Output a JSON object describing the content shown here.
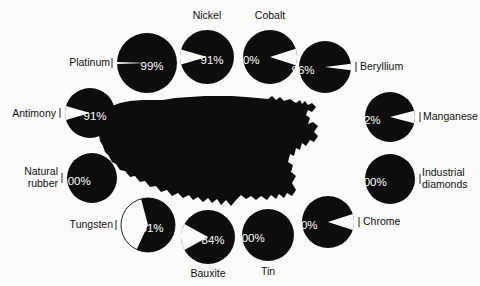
{
  "figure": {
    "background_color": "#fbfbfb",
    "dark_color": "#0d0d0d",
    "light_color": "#fbfbfb",
    "map_name": "united-states-silhouette"
  },
  "chart_data": {
    "type": "pie",
    "title": "",
    "subtitle": "",
    "xlabel": "",
    "ylabel": "",
    "legend": "none",
    "grid": false,
    "units": "percent",
    "categories": [
      "Platinum",
      "Nickel",
      "Cobalt",
      "Beryllium",
      "Manganese",
      "Industrial diamonds",
      "Chrome",
      "Tin",
      "Bauxite",
      "Tungsten",
      "Natural rubber",
      "Antimony"
    ],
    "values": [
      99,
      91,
      90,
      96,
      92,
      100,
      90,
      100,
      84,
      61,
      100,
      91
    ],
    "series": [
      {
        "name": "share",
        "values": [
          99,
          91,
          90,
          96,
          92,
          100,
          90,
          100,
          84,
          61,
          100,
          91
        ]
      }
    ]
  },
  "pies": [
    {
      "id": "platinum",
      "label": "Platinum",
      "value_text": "99%",
      "value": 99,
      "cx": 147,
      "cy": 63,
      "r": 30,
      "label_x": 110,
      "label_y": 66,
      "label_anchor": "end",
      "pct_x": 152,
      "pct_y": 67,
      "wedge_dir": "left",
      "inverted": false
    },
    {
      "id": "nickel",
      "label": "Nickel",
      "value_text": "91%",
      "value": 91,
      "cx": 207,
      "cy": 57,
      "r": 27,
      "label_x": 207,
      "label_y": 19,
      "label_anchor": "middle",
      "pct_x": 212,
      "pct_y": 61,
      "wedge_dir": "left",
      "inverted": false
    },
    {
      "id": "cobalt",
      "label": "Cobalt",
      "value_text": "90%",
      "value": 90,
      "cx": 270,
      "cy": 57,
      "r": 27,
      "label_x": 270,
      "label_y": 19,
      "label_anchor": "middle",
      "pct_x": 248,
      "pct_y": 61,
      "wedge_dir": "right",
      "inverted": false
    },
    {
      "id": "beryllium",
      "label": "Beryllium",
      "value_text": "96%",
      "value": 96,
      "cx": 325,
      "cy": 67,
      "r": 26,
      "label_x": 360,
      "label_y": 70,
      "label_anchor": "start",
      "pct_x": 303,
      "pct_y": 71,
      "wedge_dir": "right",
      "inverted": false
    },
    {
      "id": "manganese",
      "label": "Manganese",
      "value_text": "92%",
      "value": 92,
      "cx": 390,
      "cy": 117,
      "r": 25,
      "label_x": 423,
      "label_y": 120,
      "label_anchor": "start",
      "pct_x": 369,
      "pct_y": 121,
      "wedge_dir": "right",
      "inverted": false
    },
    {
      "id": "industrial-diamonds",
      "label": "Industrial\ndiamonds",
      "label_line1": "Industrial",
      "label_line2": "diamonds",
      "value_text": "100%",
      "value": 100,
      "cx": 390,
      "cy": 179,
      "r": 25,
      "label_x": 422,
      "label_y": 176,
      "label_anchor": "start",
      "pct_x": 372,
      "pct_y": 183,
      "wedge_dir": "none",
      "inverted": false
    },
    {
      "id": "chrome",
      "label": "Chrome",
      "value_text": "90%",
      "value": 90,
      "cx": 328,
      "cy": 222,
      "r": 26,
      "label_x": 363,
      "label_y": 225,
      "label_anchor": "start",
      "pct_x": 306,
      "pct_y": 226,
      "wedge_dir": "right",
      "inverted": false
    },
    {
      "id": "tin",
      "label": "Tin",
      "value_text": "100%",
      "value": 100,
      "cx": 268,
      "cy": 235,
      "r": 26,
      "label_x": 268,
      "label_y": 275,
      "label_anchor": "middle",
      "pct_x": 250,
      "pct_y": 239,
      "wedge_dir": "none",
      "inverted": false
    },
    {
      "id": "bauxite",
      "label": "Bauxite",
      "value_text": "84%",
      "value": 84,
      "cx": 208,
      "cy": 237,
      "r": 27,
      "label_x": 208,
      "label_y": 277,
      "label_anchor": "middle",
      "pct_x": 213,
      "pct_y": 241,
      "wedge_dir": "left",
      "inverted": false
    },
    {
      "id": "tungsten",
      "label": "Tungsten",
      "value_text": "61%",
      "value": 61,
      "cx": 148,
      "cy": 225,
      "r": 27,
      "label_x": 113,
      "label_y": 228,
      "label_anchor": "end",
      "pct_x": 152,
      "pct_y": 229,
      "wedge_dir": "left-half",
      "inverted": true
    },
    {
      "id": "natural-rubber",
      "label": "Natural\nrubber",
      "label_line1": "Natural",
      "label_line2": "rubber",
      "value_text": "100%",
      "value": 100,
      "cx": 92,
      "cy": 178,
      "r": 25,
      "label_x": 58,
      "label_y": 175,
      "label_anchor": "end",
      "pct_x": 76,
      "pct_y": 182,
      "wedge_dir": "none",
      "inverted": false
    },
    {
      "id": "antimony",
      "label": "Antimony",
      "value_text": "91%",
      "value": 91,
      "cx": 90,
      "cy": 113,
      "r": 25,
      "label_x": 56,
      "label_y": 117,
      "label_anchor": "end",
      "pct_x": 95,
      "pct_y": 117,
      "wedge_dir": "left",
      "inverted": false
    }
  ]
}
